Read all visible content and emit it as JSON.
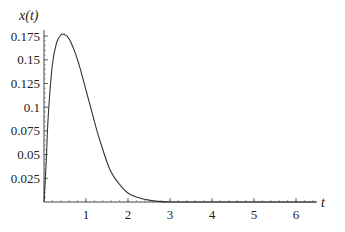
{
  "chart_data": {
    "type": "line",
    "title": "",
    "xlabel": "t",
    "ylabel": "x(t)",
    "xlim": [
      0,
      6.5
    ],
    "ylim": [
      0,
      0.18
    ],
    "grid": false,
    "legend": null,
    "x_ticks": [
      "1",
      "2",
      "3",
      "4",
      "5",
      "6"
    ],
    "y_ticks": [
      "0.025",
      "0.05",
      "0.075",
      "0.1",
      "0.125",
      "0.15",
      "0.175"
    ],
    "series": [
      {
        "name": "x(t)",
        "x": [
          0,
          0.05,
          0.1,
          0.2,
          0.3,
          0.4,
          0.47,
          0.6,
          0.8,
          1.0,
          1.2,
          1.33,
          1.57,
          1.81,
          2.05,
          2.5,
          3.0,
          4.0,
          5.0,
          6.0,
          6.5
        ],
        "y": [
          0,
          0.04,
          0.09,
          0.145,
          0.168,
          0.176,
          0.177,
          0.172,
          0.15,
          0.118,
          0.085,
          0.065,
          0.034,
          0.018,
          0.008,
          0.002,
          0,
          0,
          0,
          0,
          0
        ]
      }
    ]
  }
}
